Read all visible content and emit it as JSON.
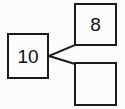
{
  "diagram": {
    "type": "number-bond",
    "title": "",
    "background_color": "#fcfcfc",
    "stroke_color": "#1b1b1b",
    "text_color": "#111111",
    "whole": {
      "label": "10",
      "name": "whole-box"
    },
    "parts": [
      {
        "label": "8",
        "name": "part-box-top",
        "filled": true
      },
      {
        "label": "",
        "name": "part-box-bottom",
        "filled": false
      }
    ],
    "connectors": [
      {
        "name": "connector-to-top-part",
        "from": [
          49,
          56
        ],
        "to": [
          75,
          45
        ]
      },
      {
        "name": "connector-to-bottom-part",
        "from": [
          49,
          56
        ],
        "to": [
          75,
          64
        ]
      }
    ]
  }
}
